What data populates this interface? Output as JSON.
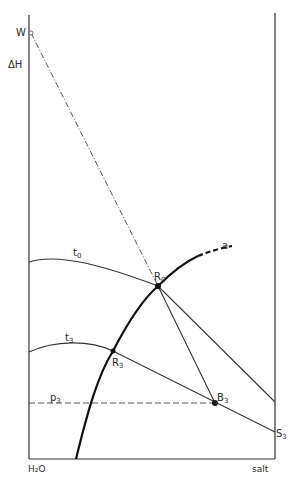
{
  "diagram": {
    "type": "enthalpy-concentration diagram",
    "axes": {
      "y_label": "ΔH",
      "x_left_label": "H₂O",
      "x_right_label": "salt"
    },
    "points": {
      "W": {
        "label": "W",
        "sub": ""
      },
      "R0": {
        "label": "R",
        "sub": "0"
      },
      "R3": {
        "label": "R",
        "sub": "3"
      },
      "B3": {
        "label": "B",
        "sub": "3"
      },
      "S3": {
        "label": "S",
        "sub": "3"
      }
    },
    "curves": {
      "t0": {
        "label": "t",
        "sub": "0"
      },
      "t3": {
        "label": "t",
        "sub": "3"
      },
      "a": {
        "label": "a"
      },
      "p3": {
        "label": "p",
        "sub": "3"
      }
    }
  }
}
